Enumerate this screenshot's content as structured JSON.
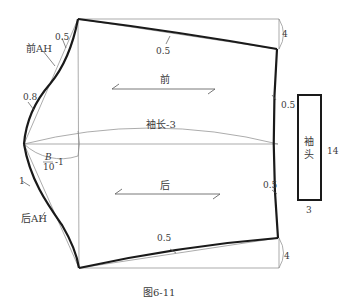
{
  "figure": {
    "caption": "图6-11",
    "labels": {
      "front": "前",
      "back": "后",
      "sleeve_length": "袖长-3",
      "front_ah": "前AH",
      "back_ah": "后AH",
      "cuff": "袖头",
      "cuff_length": "14",
      "cuff_width": "3",
      "b_num": "B",
      "b_den": "10",
      "b_minus": "-1",
      "front_top_offset": "0.5",
      "front_hem_curve": "0.5",
      "front_right_drop": "4",
      "front_right_curve": "0.5",
      "front_ah_curve": "0.8",
      "back_ah_curve": "1",
      "back_right_curve": "0.5",
      "back_hem_curve": "0.5",
      "back_right_drop": "4"
    },
    "colors": {
      "outline": "#1a1a1a",
      "guide": "#777777",
      "text": "#3a3a3a"
    }
  }
}
